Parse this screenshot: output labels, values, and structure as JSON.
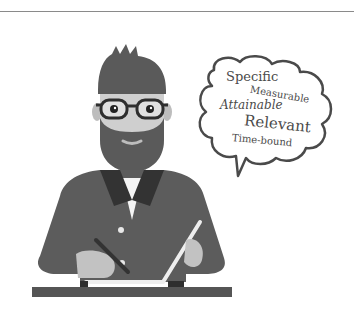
{
  "illustration": {
    "description": "Bearded man with glasses writing on a tablet, thought bubble with SMART goals",
    "thought_bubble": {
      "words": [
        "Specific",
        "Measurable",
        "Attainable",
        "Relevant",
        "Time-bound"
      ]
    },
    "colors": {
      "shirt": "#5c5c5c",
      "collar": "#333333",
      "hair_beard": "#5a5a5a",
      "skin": "#c8c8c8",
      "desk": "#555555",
      "outline": "#4a4a4a"
    }
  }
}
